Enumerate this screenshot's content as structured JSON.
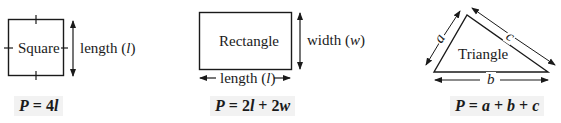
{
  "shapes": {
    "square": {
      "name": "Square",
      "dimension_label": "length (l)",
      "dimension_text": "length (",
      "dimension_var": "l",
      "dimension_close": ")",
      "formula": "P = 4l",
      "formula_parts": {
        "p": "P",
        "eq": " = ",
        "coef": "4",
        "var": "l"
      }
    },
    "rectangle": {
      "name": "Rectangle",
      "width_text": "width (",
      "width_var": "w",
      "width_close": ")",
      "length_text": "length (",
      "length_var": "l",
      "length_close": ")",
      "formula": "P = 2l + 2w",
      "formula_parts": {
        "p": "P",
        "eq": " = ",
        "c1": "2",
        "v1": "l",
        "plus": " + ",
        "c2": "2",
        "v2": "w"
      }
    },
    "triangle": {
      "name": "Triangle",
      "side_a": "a",
      "side_b": "b",
      "side_c": "c",
      "formula": "P = a + b + c",
      "formula_parts": {
        "p": "P",
        "eq": " = ",
        "a": "a",
        "plus1": " + ",
        "b": "b",
        "plus2": " + ",
        "c": "c"
      }
    }
  },
  "colors": {
    "stroke": "#1a1a1a",
    "formula_bg": "#f2f2f2"
  }
}
